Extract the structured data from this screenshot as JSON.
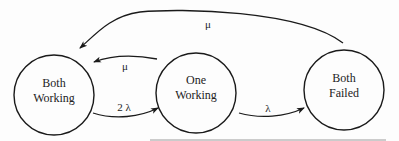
{
  "diagram": {
    "type": "state-transition",
    "states": [
      {
        "id": "both_working",
        "line1": "Both",
        "line2": "Working"
      },
      {
        "id": "one_working",
        "line1": "One",
        "line2": "Working"
      },
      {
        "id": "both_failed",
        "line1": "Both",
        "line2": "Failed"
      }
    ],
    "transitions": [
      {
        "from": "both_failed",
        "to": "both_working",
        "label": "μ"
      },
      {
        "from": "one_working",
        "to": "both_working",
        "label": "μ"
      },
      {
        "from": "both_working",
        "to": "one_working",
        "label": "2 λ"
      },
      {
        "from": "one_working",
        "to": "both_failed",
        "label": "λ"
      }
    ]
  },
  "colors": {
    "stroke": "#1a1a1a",
    "text": "#222222",
    "baseline": "#9a9a9a"
  }
}
